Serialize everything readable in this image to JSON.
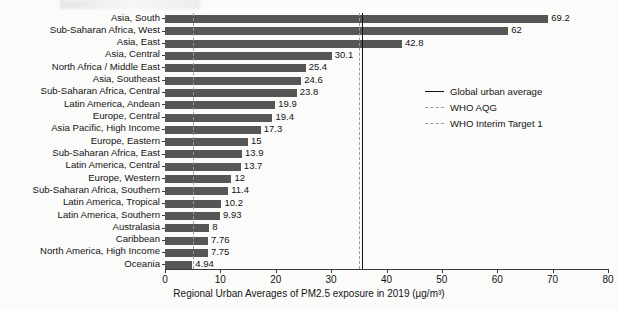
{
  "chart_data": {
    "type": "bar",
    "orientation": "horizontal",
    "title": "",
    "xlabel": "Regional Urban Averages of PM2.5 exposure in 2019 (µg/m³)",
    "ylabel": "",
    "xlim": [
      0,
      80
    ],
    "xticks": [
      0,
      10,
      20,
      30,
      40,
      50,
      60,
      70,
      80
    ],
    "xtick_labels": [
      "0",
      "10",
      "20",
      "30",
      "40",
      "50",
      "60",
      "70",
      "80"
    ],
    "grid": false,
    "legend_position": "center-right",
    "bar_color": "#565656",
    "categories": [
      "Asia, South",
      "Sub-Saharan Africa, West",
      "Asia, East",
      "Asia, Central",
      "North Africa / Middle East",
      "Asia, Southeast",
      "Sub-Saharan Africa, Central",
      "Latin America, Andean",
      "Europe, Central",
      "Asia Pacific, High Income",
      "Europe, Eastern",
      "Sub-Saharan Africa, East",
      "Latin America, Central",
      "Europe, Western",
      "Sub-Saharan Africa, Southern",
      "Latin America, Tropical",
      "Latin America, Southern",
      "Australasia",
      "Caribbean",
      "North America, High Income",
      "Oceania"
    ],
    "values": [
      69.2,
      62,
      42.8,
      30.1,
      25.4,
      24.6,
      23.8,
      19.9,
      19.4,
      17.3,
      15,
      13.9,
      13.7,
      12,
      11.4,
      10.2,
      9.93,
      8,
      7.76,
      7.75,
      4.94
    ],
    "value_labels": [
      "69.2",
      "62",
      "42.8",
      "30.1",
      "25.4",
      "24.6",
      "23.8",
      "19.9",
      "19.4",
      "17.3",
      "15",
      "13.9",
      "13.7",
      "12",
      "11.4",
      "10.2",
      "9.93",
      "8",
      "7.76",
      "7.75",
      "4.94"
    ],
    "reference_lines": [
      {
        "label": "Global urban average",
        "value": 35.5,
        "style": "solid",
        "color": "#111111"
      },
      {
        "label": "WHO AQG",
        "value": 5,
        "style": "dashed",
        "color": "#9a9a9a"
      },
      {
        "label": "WHO Interim Target 1",
        "value": 35,
        "style": "dashed",
        "color": "#9a9a9a"
      }
    ]
  },
  "legend": {
    "items": [
      {
        "label": "Global urban average",
        "style": "solid"
      },
      {
        "label": "WHO AQG",
        "style": "dashed"
      },
      {
        "label": "WHO Interim Target 1",
        "style": "dashed"
      }
    ]
  }
}
